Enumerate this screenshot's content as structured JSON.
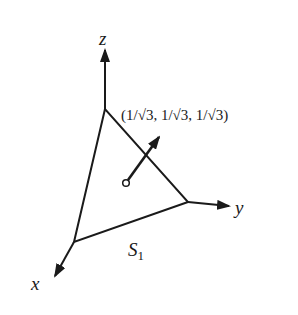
{
  "diagram": {
    "type": "3d-surface-normal",
    "colors": {
      "background": "#ffffff",
      "stroke": "#1a1a1a"
    },
    "axes": {
      "x": {
        "label": "x"
      },
      "y": {
        "label": "y"
      },
      "z": {
        "label": "z"
      }
    },
    "surface": {
      "name": "S",
      "subscript": "1",
      "shape": "triangle"
    },
    "normal_vector": {
      "label": "(1/√3, 1/√3, 1/√3)"
    }
  }
}
